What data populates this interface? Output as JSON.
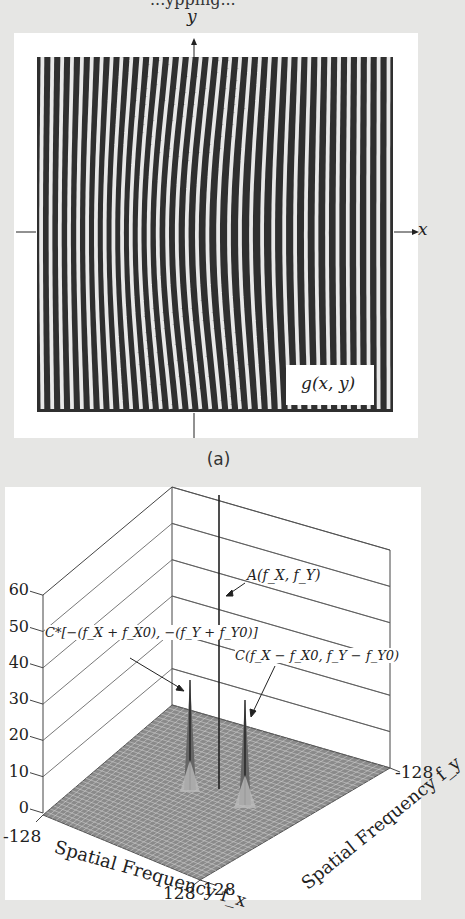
{
  "header": {
    "cut_text": "...ypping..."
  },
  "panel_a": {
    "axis_y_label": "y",
    "axis_x_label": "x",
    "function_label": "g(x, y)",
    "caption": "(a)",
    "fringe_count": 36
  },
  "panel_b": {
    "annotations": {
      "center": "A(f_X, f_Y)",
      "left": "C*[−(f_X + f_X0), −(f_Y + f_Y0)]",
      "right": "C(f_X − f_X0, f_Y − f_Y0)"
    }
  },
  "chart_data": {
    "type": "surface3d",
    "title": "",
    "zlabel": "",
    "z_ticks": [
      0,
      10,
      20,
      30,
      40,
      50,
      60
    ],
    "zlim": [
      0,
      60
    ],
    "xlabel": "Spatial Frequency f_x",
    "ylabel": "Spatial Frequency f_y",
    "x_ticks": [
      "-128",
      "128"
    ],
    "y_ticks": [
      "-128",
      "128"
    ],
    "xlim": [
      -128,
      128
    ],
    "ylim": [
      -128,
      128
    ],
    "grid": true,
    "peaks": [
      {
        "name": "C*[−(f_X + f_X0), −(f_Y + f_Y0)]",
        "position": "left sideband",
        "approx_height": 32
      },
      {
        "name": "A(f_X, f_Y)",
        "position": "center (DC)",
        "approx_height": 80
      },
      {
        "name": "C(f_X − f_X0, f_Y − f_Y0)",
        "position": "right sideband",
        "approx_height": 28
      }
    ],
    "floor_value": 0
  }
}
